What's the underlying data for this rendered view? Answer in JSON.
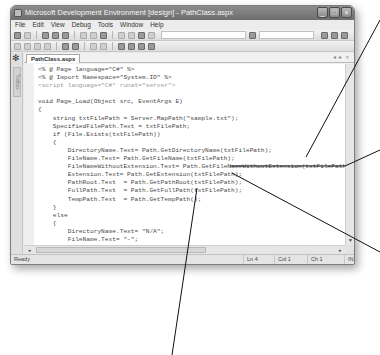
{
  "window": {
    "title": "Microsoft Development Environment [design] - PathClass.aspx",
    "controls": {
      "minimize": "_",
      "maximize": "□",
      "close": "×"
    }
  },
  "menubar": {
    "items": [
      "File",
      "Edit",
      "View",
      "Debug",
      "Tools",
      "Window",
      "Help"
    ]
  },
  "toolbar": {
    "icons": [
      "new-project-icon",
      "add-item-icon",
      "open-icon",
      "save-icon",
      "save-all-icon",
      "cut-icon",
      "copy-icon",
      "paste-icon",
      "undo-icon",
      "redo-icon",
      "start-icon",
      "configuration-combo",
      "find-icon",
      "solution-explorer-icon",
      "properties-icon",
      "toolbox-icon"
    ]
  },
  "toolbox": {
    "label": "Toolbox"
  },
  "editor": {
    "tab_label": "PathClass.aspx",
    "tab_controls": "◂ ▸ ×",
    "code_lines": [
      {
        "text": "<% @ Page language=\"C#\" %>",
        "dim": false
      },
      {
        "text": "<% @ Import Namespace=\"System.IO\" %>",
        "dim": false
      },
      {
        "text": "<script language=\"C#\" runat=\"server\">",
        "dim": true
      },
      {
        "text": "",
        "dim": false
      },
      {
        "text": "void Page_Load(Object src, EventArgs E)",
        "dim": false
      },
      {
        "text": "{",
        "dim": false
      },
      {
        "text": "    string txtFilePath = Server.MapPath(\"sample.txt\");",
        "dim": false
      },
      {
        "text": "    SpecifiedFilePath.Text = txtFilePath;",
        "dim": false
      },
      {
        "text": "    if (File.Exists(txtFilePath))",
        "dim": false
      },
      {
        "text": "    {",
        "dim": false
      },
      {
        "text": "        DirectoryName.Text= Path.GetDirectoryName(txtFilePath);",
        "dim": false
      },
      {
        "text": "        FileName.Text= Path.GetFileName(txtFilePath);",
        "dim": false
      },
      {
        "text": "        FileNameWithoutExtension.Text= Path.GetFileNameWithoutExtension(txtFilePath);",
        "dim": false
      },
      {
        "text": "        Extension.Text= Path.GetExtension(txtFilePath);",
        "dim": false
      },
      {
        "text": "        PathRoot.Text  = Path.GetPathRoot(txtFilePath);",
        "dim": false
      },
      {
        "text": "        FullPath.Text  = Path.GetFullPath(txtFilePath);",
        "dim": false
      },
      {
        "text": "        TempPath.Text  = Path.GetTempPath();",
        "dim": false
      },
      {
        "text": "    }",
        "dim": false
      },
      {
        "text": "    else",
        "dim": false
      },
      {
        "text": "    {",
        "dim": false
      },
      {
        "text": "        DirectoryName.Text= \"N/A\";",
        "dim": false
      },
      {
        "text": "        FileName.Text= \"-\";",
        "dim": false
      },
      {
        "text": "        FileNameWithoutExtension.Text= \"-\";",
        "dim": false
      },
      {
        "text": "        Extension.Text= \"-\";",
        "dim": false
      },
      {
        "text": "        PathRoot.Text  = \"-\";",
        "dim": false
      },
      {
        "text": "        FullPath.Text  = \"-\";",
        "dim": false
      }
    ]
  },
  "statusbar": {
    "status": "Ready",
    "line": "Ln 4",
    "col": "Col 1",
    "ch": "Ch 1",
    "mode": "INS"
  },
  "colors": {
    "titlebar": "#7d7d7d",
    "chrome": "#e9e9e9",
    "editor_bg": "#ffffff",
    "code_text": "#4a4a4a",
    "callout_line": "#111111"
  }
}
